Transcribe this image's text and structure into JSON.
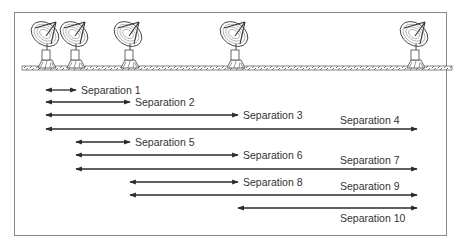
{
  "diagram": {
    "antennas": [
      {
        "id": "A1",
        "position": 0
      },
      {
        "id": "A2",
        "position": 1
      },
      {
        "id": "A3",
        "position": 3
      },
      {
        "id": "A4",
        "position": 7
      },
      {
        "id": "A5",
        "position": 14
      }
    ],
    "separations": [
      {
        "label": "Separation 1",
        "from": 0,
        "to": 1,
        "label_pos": "right"
      },
      {
        "label": "Separation 2",
        "from": 0,
        "to": 2,
        "label_pos": "right"
      },
      {
        "label": "Separation 3",
        "from": 0,
        "to": 3,
        "label_pos": "right"
      },
      {
        "label": "Separation 4",
        "from": 0,
        "to": 4,
        "label_pos": "above"
      },
      {
        "label": "Separation 5",
        "from": 1,
        "to": 2,
        "label_pos": "right"
      },
      {
        "label": "Separation 6",
        "from": 1,
        "to": 3,
        "label_pos": "right"
      },
      {
        "label": "Separation 7",
        "from": 1,
        "to": 4,
        "label_pos": "above"
      },
      {
        "label": "Separation 8",
        "from": 2,
        "to": 3,
        "label_pos": "right"
      },
      {
        "label": "Separation 9",
        "from": 2,
        "to": 4,
        "label_pos": "above"
      },
      {
        "label": "Separation 10",
        "from": 3,
        "to": 4,
        "label_pos": "below"
      }
    ],
    "colors": {
      "line": "#2a2a2a",
      "text": "#333333",
      "frame": "#8a8a8a",
      "track": "#555555"
    }
  }
}
